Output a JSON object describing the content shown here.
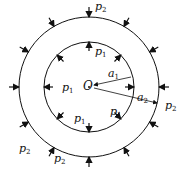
{
  "diagram": {
    "center_label": "O",
    "inner_radius_label": {
      "base": "a",
      "sub": "1"
    },
    "outer_radius_label": {
      "base": "a",
      "sub": "2"
    },
    "inner_pressure": {
      "base": "p",
      "sub": "1"
    },
    "outer_pressure": {
      "base": "p",
      "sub": "2"
    },
    "colors": {
      "stroke": "#111111",
      "background": "#ffffff"
    }
  }
}
